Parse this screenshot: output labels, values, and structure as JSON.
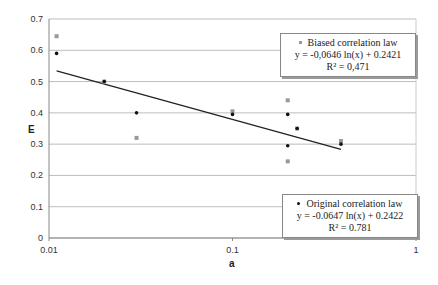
{
  "chart_data": {
    "type": "scatter",
    "title": "",
    "xlabel": "a",
    "ylabel": "E",
    "xscale": "log",
    "xlim": [
      0.01,
      1
    ],
    "ylim": [
      0,
      0.7
    ],
    "x_ticks": [
      "0.01",
      "0.1",
      "1"
    ],
    "y_ticks": [
      "0",
      "0.1",
      "0.2",
      "0.3",
      "0.4",
      "0.5",
      "0.6",
      "0.7"
    ],
    "grid": "horizontal",
    "series": [
      {
        "name": "Biased correlation law",
        "marker": "square",
        "color": "#999999",
        "points": [
          [
            0.011,
            0.645
          ],
          [
            0.02,
            0.5
          ],
          [
            0.03,
            0.32
          ],
          [
            0.1,
            0.405
          ],
          [
            0.2,
            0.44
          ],
          [
            0.2,
            0.245
          ],
          [
            0.225,
            0.35
          ],
          [
            0.39,
            0.31
          ]
        ],
        "equation": "y = -0,0646 ln(x) + 0.2421",
        "r2": "R² = 0,471"
      },
      {
        "name": "Original correlation law",
        "marker": "dot",
        "color": "#111111",
        "points": [
          [
            0.011,
            0.59
          ],
          [
            0.02,
            0.5
          ],
          [
            0.03,
            0.4
          ],
          [
            0.1,
            0.395
          ],
          [
            0.2,
            0.395
          ],
          [
            0.2,
            0.295
          ],
          [
            0.225,
            0.35
          ],
          [
            0.39,
            0.3
          ]
        ],
        "equation": "y = -0.0647 ln(x) + 0.2422",
        "r2": "R² = 0.781"
      }
    ],
    "trendline": {
      "x": [
        0.011,
        0.39
      ],
      "y": [
        0.534,
        0.283
      ],
      "color": "#222222"
    },
    "legend_position": "inside-right"
  },
  "legend": {
    "biased": {
      "title": "Biased correlation law",
      "equation": "y = -0,0646 ln(x) + 0.2421",
      "r2": "R² = 0,471"
    },
    "original": {
      "title": "Original correlation law",
      "equation": "y = -0.0647 ln(x) + 0.2422",
      "r2": "R² = 0.781"
    }
  },
  "axes": {
    "xlabel": "a",
    "ylabel": "E"
  }
}
